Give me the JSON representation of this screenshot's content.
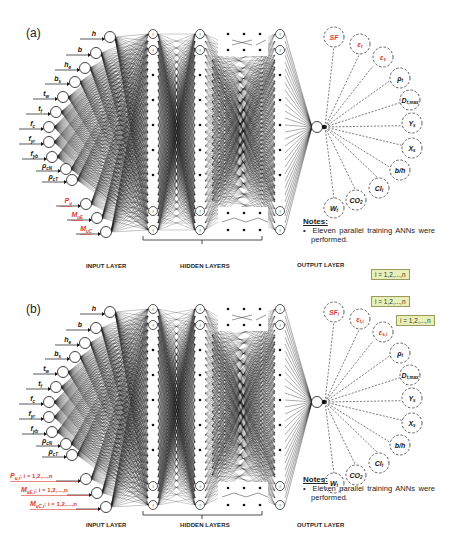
{
  "panels": [
    {
      "label": "(a)",
      "inputs": [
        {
          "main": "h",
          "sub": "",
          "suffix": "",
          "red": false
        },
        {
          "main": "b",
          "sub": "",
          "suffix": "",
          "red": false
        },
        {
          "main": "h",
          "sub": "e",
          "suffix": "",
          "red": false
        },
        {
          "main": "b",
          "sub": "s",
          "suffix": "",
          "red": false
        },
        {
          "main": "t",
          "sub": "w",
          "suffix": "",
          "red": false
        },
        {
          "main": "t",
          "sub": "f",
          "suffix": "",
          "red": false
        },
        {
          "main": "f",
          "sub": "c",
          "suffix": "",
          "red": false
        },
        {
          "main": "f",
          "sub": "yr",
          "suffix": "",
          "red": false
        },
        {
          "main": "f",
          "sub": "yb",
          "suffix": "",
          "red": false
        },
        {
          "main": "ρ",
          "sub": "cN",
          "suffix": "",
          "red": false
        },
        {
          "main": "ρ",
          "sub": "cT",
          "suffix": "",
          "red": false
        },
        {
          "main": "P",
          "sub": "u",
          "suffix": "",
          "red": true
        },
        {
          "main": "M",
          "sub": "uE",
          "suffix": "",
          "red": true
        },
        {
          "main": "M",
          "sub": "uC",
          "suffix": "",
          "red": true
        }
      ],
      "outputs": [
        {
          "main": "SF",
          "sub": "",
          "red": true
        },
        {
          "main": "ε",
          "sub": "t",
          "red": true
        },
        {
          "main": "ε",
          "sub": "s",
          "red": true
        },
        {
          "main": "ρ",
          "sub": "t",
          "red": false
        },
        {
          "main": "D",
          "sub": "t,max",
          "red": false
        },
        {
          "main": "Y",
          "sub": "s",
          "red": false
        },
        {
          "main": "X",
          "sub": "s",
          "red": false
        },
        {
          "main": "b/h",
          "sub": "",
          "red": false
        },
        {
          "main": "Cl",
          "sub": "t",
          "red": false
        },
        {
          "main": "CO",
          "sub": "2",
          "red": false
        },
        {
          "main": "W",
          "sub": "t",
          "red": false
        }
      ],
      "iteration_tags": [],
      "notes_title": "Notes:",
      "notes_items": [
        "Eleven parallel training ANNs were performed."
      ],
      "layer_labels": {
        "input": "INPUT LAYER",
        "hidden": "HIDDEN LAYERS",
        "output": "OUTPUT LAYER"
      }
    },
    {
      "label": "(b)",
      "inputs": [
        {
          "main": "h",
          "sub": "",
          "suffix": "",
          "red": false
        },
        {
          "main": "b",
          "sub": "",
          "suffix": "",
          "red": false
        },
        {
          "main": "h",
          "sub": "e",
          "suffix": "",
          "red": false
        },
        {
          "main": "b",
          "sub": "s",
          "suffix": "",
          "red": false
        },
        {
          "main": "t",
          "sub": "w",
          "suffix": "",
          "red": false
        },
        {
          "main": "t",
          "sub": "f",
          "suffix": "",
          "red": false
        },
        {
          "main": "f",
          "sub": "c",
          "suffix": "",
          "red": false
        },
        {
          "main": "f",
          "sub": "yr",
          "suffix": "",
          "red": false
        },
        {
          "main": "f",
          "sub": "yb",
          "suffix": "",
          "red": false
        },
        {
          "main": "ρ",
          "sub": "cN",
          "suffix": "",
          "red": false
        },
        {
          "main": "ρ",
          "sub": "cT",
          "suffix": "",
          "red": false
        },
        {
          "main": "P",
          "sub": "u,i",
          "suffix": "; i = 1,2,...,n",
          "red": true
        },
        {
          "main": "M",
          "sub": "uE,i",
          "suffix": "; i = 1,2,...,n",
          "red": true
        },
        {
          "main": "M",
          "sub": "uC,i",
          "suffix": "; i = 1,2,...,n",
          "red": true
        }
      ],
      "outputs": [
        {
          "main": "SF",
          "sub": "i",
          "red": true
        },
        {
          "main": "ε",
          "sub": "t,i",
          "red": true
        },
        {
          "main": "ε",
          "sub": "s,i",
          "red": true
        },
        {
          "main": "ρ",
          "sub": "t",
          "red": false
        },
        {
          "main": "D",
          "sub": "t,max",
          "red": false
        },
        {
          "main": "Y",
          "sub": "s",
          "red": false
        },
        {
          "main": "X",
          "sub": "s",
          "red": false
        },
        {
          "main": "b/h",
          "sub": "",
          "red": false
        },
        {
          "main": "Cl",
          "sub": "t",
          "red": false
        },
        {
          "main": "CO",
          "sub": "2",
          "red": false
        },
        {
          "main": "W",
          "sub": "t",
          "red": false
        }
      ],
      "iteration_tags": [
        "i = 1,2,...,n",
        "i = 1,2,...,n",
        "i = 1,2,...,n"
      ],
      "notes_title": "Notes:",
      "notes_items": [
        "Eleven parallel training ANNs were performed."
      ],
      "layer_labels": {
        "input": "INPUT LAYER",
        "hidden": "HIDDEN LAYERS",
        "output": "OUTPUT LAYER"
      }
    }
  ],
  "colors": {
    "red_label": "#d63a2f",
    "line": "#1a1a1a",
    "tag_bg": "#e8f0b8",
    "tag_border": "#9a9a60"
  }
}
